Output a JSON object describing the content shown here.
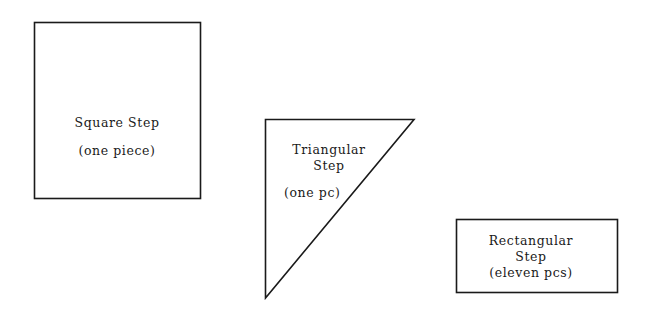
{
  "diagram": {
    "shapes": [
      {
        "id": "square",
        "type": "rectangle",
        "title": "Square Step",
        "subtitle": "(one piece)"
      },
      {
        "id": "triangle",
        "type": "right-triangle",
        "title_line1": "Triangular",
        "title_line2": "Step",
        "subtitle": "(one pc)"
      },
      {
        "id": "rectangle",
        "type": "rectangle",
        "title_line1": "Rectangular",
        "title_line2": "Step",
        "subtitle": "(eleven pcs)"
      }
    ],
    "stroke_color": "#1a1a1a",
    "background": "#ffffff"
  }
}
